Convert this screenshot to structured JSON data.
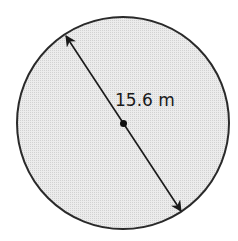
{
  "diagram": {
    "shape": "circle",
    "fill_color": "#e4e4e4",
    "stroke_color": "#2a2a2a",
    "measurement": {
      "type": "diameter",
      "label": "15.6 m"
    },
    "center_marker": "dot"
  }
}
